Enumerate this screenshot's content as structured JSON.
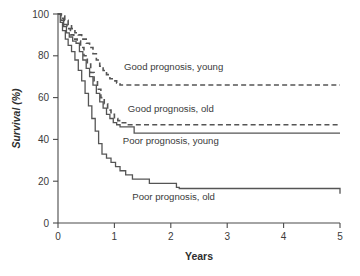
{
  "chart_data": {
    "type": "line",
    "title": "",
    "xlabel": "Years",
    "ylabel": "Survival (%)",
    "xlim": [
      0,
      5
    ],
    "ylim": [
      0,
      100
    ],
    "xticks": [
      0,
      1,
      2,
      3,
      4,
      5
    ],
    "yticks": [
      0,
      20,
      40,
      60,
      80,
      100
    ],
    "xtick_labels": [
      "0",
      "1",
      "2",
      "3",
      "4",
      "5"
    ],
    "ytick_labels": [
      "0",
      "20",
      "40",
      "60",
      "80",
      "100"
    ],
    "grid": false,
    "legend_position": "inline-annotations",
    "line_color": "#555555",
    "series": [
      {
        "name": "Good prognosis, young",
        "style": "dashed",
        "label": "Good prognosis, young",
        "label_x": 2.05,
        "label_y": 73,
        "plateau_value": 66,
        "x": [
          0,
          0.06,
          0.12,
          0.18,
          0.24,
          0.3,
          0.36,
          0.42,
          0.5,
          0.56,
          0.62,
          0.68,
          0.74,
          0.8,
          0.86,
          0.92,
          0.98,
          1.04,
          1.1,
          5
        ],
        "y": [
          100,
          99,
          97,
          95,
          93,
          91,
          90,
          88,
          86,
          84,
          81,
          78,
          75,
          73,
          71,
          69,
          68,
          67,
          66,
          66
        ]
      },
      {
        "name": "Good prognosis, old",
        "style": "dashed",
        "label": "Good prognosis, old",
        "label_x": 2.0,
        "label_y": 53,
        "plateau_value": 47,
        "x": [
          0,
          0.05,
          0.1,
          0.16,
          0.22,
          0.28,
          0.34,
          0.4,
          0.46,
          0.52,
          0.58,
          0.64,
          0.7,
          0.76,
          0.82,
          0.88,
          0.94,
          1.0,
          1.06,
          1.12,
          1.2,
          5
        ],
        "y": [
          100,
          98,
          95,
          93,
          90,
          88,
          87,
          84,
          80,
          76,
          72,
          68,
          64,
          60,
          57,
          54,
          52,
          50,
          49,
          48,
          47,
          47
        ]
      },
      {
        "name": "Poor prognosis, young",
        "style": "solid",
        "label": "Poor prognosis, young",
        "label_x": 2.0,
        "label_y": 38,
        "plateau_value": 43,
        "x": [
          0,
          0.05,
          0.1,
          0.15,
          0.2,
          0.26,
          0.32,
          0.38,
          0.44,
          0.5,
          0.56,
          0.62,
          0.68,
          0.74,
          0.8,
          0.86,
          0.92,
          0.98,
          1.04,
          1.1,
          1.35,
          5
        ],
        "y": [
          100,
          97,
          94,
          91,
          89,
          87,
          86,
          82,
          78,
          74,
          70,
          66,
          62,
          58,
          55,
          52,
          50,
          48,
          47,
          46,
          43,
          43
        ]
      },
      {
        "name": "Poor prognosis, old",
        "style": "solid",
        "label": "Poor prognosis, old",
        "label_x": 2.05,
        "label_y": 11,
        "plateau_value": 14,
        "x": [
          0,
          0.04,
          0.08,
          0.13,
          0.18,
          0.24,
          0.3,
          0.36,
          0.42,
          0.48,
          0.54,
          0.6,
          0.66,
          0.72,
          0.78,
          0.86,
          0.94,
          1.02,
          1.1,
          1.2,
          1.32,
          1.45,
          1.62,
          1.85,
          2.1,
          2.15,
          3.9,
          5
        ],
        "y": [
          100,
          96,
          92,
          88,
          85,
          82,
          78,
          73,
          68,
          62,
          56,
          50,
          44,
          38,
          33,
          31,
          29,
          27,
          25,
          23,
          21,
          21,
          19,
          19,
          17,
          16.5,
          16.5,
          14
        ]
      }
    ]
  }
}
